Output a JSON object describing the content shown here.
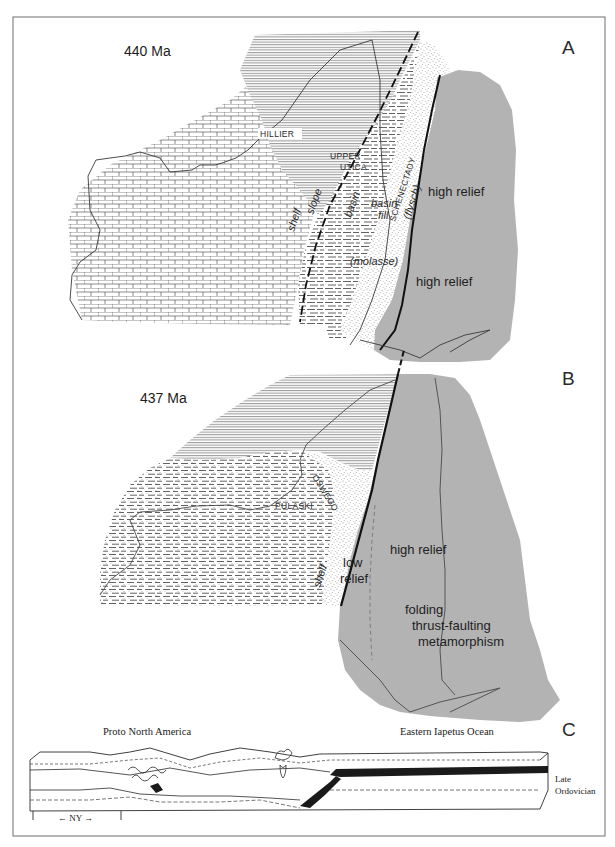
{
  "figure": {
    "panels": [
      {
        "id": "A",
        "panel_label": "A",
        "age": "440 Ma",
        "formations": [
          "HILLIER",
          "UPPER",
          "UTICA",
          "SCHENECTADY",
          "(flysch)"
        ],
        "facies": [
          "shelf",
          "slope",
          "basin",
          "basin",
          "fill",
          "(molasse)"
        ],
        "relief": [
          "high relief",
          "high relief"
        ]
      },
      {
        "id": "B",
        "panel_label": "B",
        "age": "437 Ma",
        "formations": [
          "PULASKI",
          "OSWEGO"
        ],
        "facies": [
          "shelf"
        ],
        "relief": [
          "low",
          "relief",
          "high relief"
        ],
        "processes": [
          "folding",
          "thrust-faulting",
          "metamorphism"
        ]
      },
      {
        "id": "C",
        "panel_label": "C",
        "left_caption": "Proto North America",
        "right_caption": "Eastern Iapetus Ocean",
        "period": [
          "Late",
          "Ordovician"
        ],
        "scale_label": "← NY →"
      }
    ],
    "colors": {
      "highland_fill": "#b3b3b3",
      "ink": "#1a1a1a",
      "paper": "#ffffff",
      "frame": "#6e6e6e"
    }
  }
}
